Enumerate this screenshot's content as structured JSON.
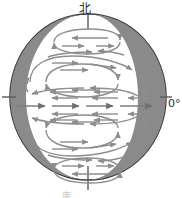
{
  "figure": {
    "kind": "earth-atmospheric-circulation-diagram",
    "background_color": "#ffffff",
    "labels": {
      "north": "北",
      "prime_meridian": "0°",
      "bottom_caption": "南"
    },
    "colors": {
      "outline": "#3a3a3a",
      "shadow_band": "#8a8a8a",
      "flow_arrow": "#8d8d8d",
      "equator_line": "#6b6b6b",
      "axis_tick": "#5a5a5a",
      "text": "#2b2b2b",
      "globe_fill": "#ffffff"
    },
    "globe": {
      "center_x": 88,
      "center_y": 97,
      "radius_x": 78,
      "radius_y": 83,
      "left_band_label": "left-limb-shading",
      "right_band_label": "right-limb-shading"
    },
    "axis": {
      "north_pole_tick": "north-pole-axis-tick",
      "south_pole_tick": "south-pole-axis-tick",
      "equator_left_tick": "equator-left-tick",
      "equator_right_tick": "equator-right-tick"
    },
    "circulation_cells": [
      {
        "id": "north-polar-cell",
        "hemisphere": "north",
        "band": "polar",
        "shape": "flattened-loop"
      },
      {
        "id": "north-ferrel-cell",
        "hemisphere": "north",
        "band": "mid-latitude",
        "shape": "large-loop"
      },
      {
        "id": "north-hadley-cell",
        "hemisphere": "north",
        "band": "tropical",
        "shape": "inner-loop"
      },
      {
        "id": "south-hadley-cell",
        "hemisphere": "south",
        "band": "tropical",
        "shape": "inner-loop"
      },
      {
        "id": "south-ferrel-cell",
        "hemisphere": "south",
        "band": "mid-latitude",
        "shape": "large-loop"
      },
      {
        "id": "south-polar-cell",
        "hemisphere": "south",
        "band": "polar",
        "shape": "flattened-loop"
      }
    ],
    "equator_flow": {
      "id": "equatorial-flow",
      "direction": "eastward",
      "arrow_count": 5
    }
  }
}
